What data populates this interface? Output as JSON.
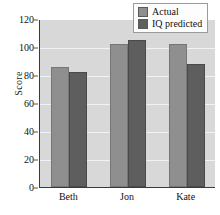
{
  "chart_data": {
    "type": "bar",
    "title": "",
    "xlabel": "",
    "ylabel": "Score",
    "categories": [
      "Beth",
      "Jon",
      "Kate"
    ],
    "series": [
      {
        "name": "Actual",
        "values": [
          86,
          102,
          102
        ],
        "color": "#8f8f8f"
      },
      {
        "name": "IQ predicted",
        "values": [
          82,
          105,
          88
        ],
        "color": "#5e5e5e"
      }
    ],
    "ylim": [
      0,
      120
    ],
    "yticks": [
      0,
      20,
      40,
      60,
      80,
      100,
      120
    ],
    "ytick_labels": [
      "0",
      "20",
      "40",
      "60",
      "80",
      "100",
      "120"
    ],
    "grid": true,
    "legend_position": "top-right",
    "plot_background": "#d8d8d8",
    "axis_color": "#3a3a3a",
    "gridline_color": "#f2f2f2"
  },
  "legend": {
    "entries": [
      {
        "label": "Actual"
      },
      {
        "label": "IQ predicted"
      }
    ]
  }
}
